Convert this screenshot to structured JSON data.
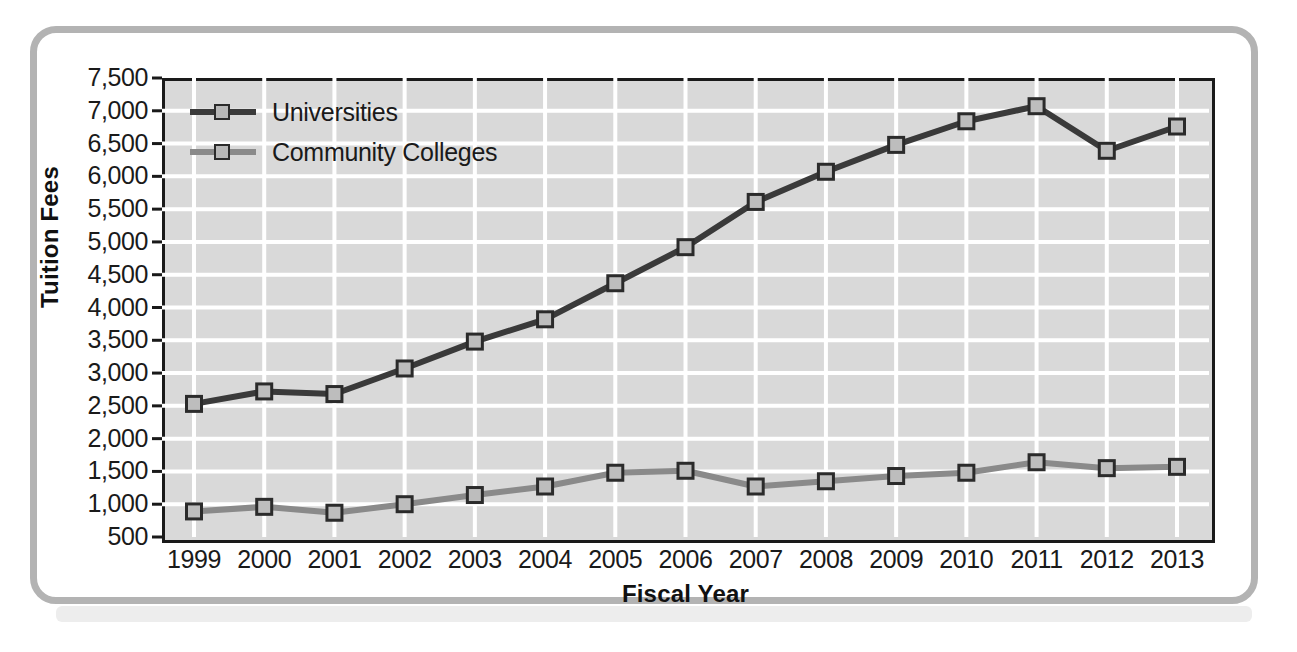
{
  "chart_data": {
    "type": "line",
    "title": "",
    "xlabel": "Fiscal Year",
    "ylabel": "Tuition Fees",
    "categories": [
      "1999",
      "2000",
      "2001",
      "2002",
      "2003",
      "2004",
      "2005",
      "2006",
      "2007",
      "2008",
      "2009",
      "2010",
      "2011",
      "2012",
      "2013"
    ],
    "x_tick_labels": [
      "1999",
      "2000",
      "2001",
      "2002",
      "2003",
      "2004",
      "2005",
      "2006",
      "2007",
      "2008",
      "2009",
      "2010",
      "2011",
      "2012",
      "2013"
    ],
    "y_tick_labels": [
      "7,500",
      "7,000",
      "6,500",
      "6,000",
      "5,500",
      "5,000",
      "4,500",
      "4,000",
      "3,500",
      "3,000",
      "2,500",
      "2,000",
      "1,500",
      "1,000",
      "500"
    ],
    "y_tick_values": [
      7500,
      7000,
      6500,
      6000,
      5500,
      5000,
      4500,
      4000,
      3500,
      3000,
      2500,
      2000,
      1500,
      1000,
      500
    ],
    "ylim": [
      500,
      7500
    ],
    "y_tick_step": 500,
    "grid": true,
    "legend_position": "top-left-inside",
    "series": [
      {
        "name": "Universities",
        "color": "#3a3a3a",
        "marker": "square",
        "values": [
          2530,
          2720,
          2680,
          3070,
          3480,
          3820,
          4370,
          4920,
          5610,
          6070,
          6480,
          6840,
          7070,
          6390,
          6760
        ]
      },
      {
        "name": "Community Colleges",
        "color": "#8a8a8a",
        "marker": "square",
        "values": [
          890,
          960,
          870,
          1000,
          1140,
          1270,
          1480,
          1510,
          1270,
          1350,
          1430,
          1480,
          1640,
          1550,
          1570
        ]
      }
    ],
    "plot_background": "#d9d9d9",
    "grid_color": "#ffffff",
    "axis_color": "#1a1a1a"
  },
  "legend": {
    "items": [
      {
        "label": "Universities"
      },
      {
        "label": "Community Colleges"
      }
    ]
  },
  "frame": {
    "border_color": "#b3b3b3"
  }
}
